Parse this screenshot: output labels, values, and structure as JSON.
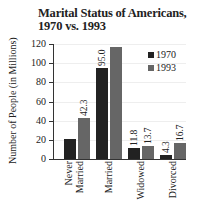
{
  "chart_data": {
    "type": "bar",
    "title": "Marital Status of Americans, 1970 vs. 1993",
    "title_lines": [
      "Marital Status of Americans,",
      "1970 vs. 1993"
    ],
    "xlabel": "",
    "ylabel": "Number of People (in Millions)",
    "ylim": [
      0,
      120
    ],
    "yticks": [
      0,
      20,
      40,
      60,
      80,
      100,
      120
    ],
    "categories": [
      "Never Married",
      "Married",
      "Widowed",
      "Divorced"
    ],
    "series": [
      {
        "name": "1970",
        "color": "#222222",
        "values": [
          21,
          95.0,
          11.8,
          4.3
        ],
        "labels": [
          "",
          "95.0",
          "11.8",
          "4.3"
        ]
      },
      {
        "name": "1993",
        "color": "#666666",
        "values": [
          42.3,
          117,
          13.7,
          16.7
        ],
        "labels": [
          "42.3",
          "",
          "13.7",
          "16.7"
        ]
      }
    ],
    "legend_position": "upper right",
    "grid": true
  }
}
